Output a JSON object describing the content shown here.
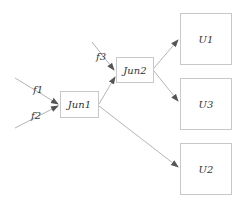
{
  "diagram": {
    "nodes": [
      {
        "id": "jun1",
        "label": "Jun1",
        "x": 60,
        "y": 91,
        "w": 39,
        "h": 27
      },
      {
        "id": "jun2",
        "label": "Jun2",
        "x": 116,
        "y": 57,
        "w": 38,
        "h": 26
      },
      {
        "id": "u1",
        "label": "U1",
        "x": 180,
        "y": 13,
        "w": 52,
        "h": 52
      },
      {
        "id": "u3",
        "label": "U3",
        "x": 180,
        "y": 78,
        "w": 52,
        "h": 52
      },
      {
        "id": "u2",
        "label": "U2",
        "x": 180,
        "y": 143,
        "w": 52,
        "h": 52
      }
    ],
    "inputs": [
      {
        "label": "f1",
        "target": "jun1"
      },
      {
        "label": "f2",
        "target": "jun1"
      },
      {
        "label": "f3",
        "target": "jun2"
      }
    ],
    "edges": [
      {
        "from": "jun1",
        "to": "jun2"
      },
      {
        "from": "jun1",
        "to": "u2"
      },
      {
        "from": "jun2",
        "to": "u1"
      },
      {
        "from": "jun2",
        "to": "u3"
      }
    ],
    "colors": {
      "line": "#b5b5b5",
      "arrow": "#555555",
      "border": "#c8c8c8"
    }
  }
}
